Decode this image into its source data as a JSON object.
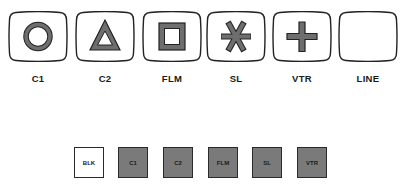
{
  "monitors": [
    {
      "label": "C1",
      "icon": "circle",
      "x": 8
    },
    {
      "label": "C2",
      "icon": "triangle",
      "x": 75
    },
    {
      "label": "FLM",
      "icon": "square",
      "x": 142
    },
    {
      "label": "SL",
      "icon": "asterisk",
      "x": 206
    },
    {
      "label": "VTR",
      "icon": "plus",
      "x": 272
    },
    {
      "label": "LINE",
      "icon": "blank",
      "x": 338
    }
  ],
  "buttons": [
    {
      "label": "BLK",
      "lit": false,
      "x": 74
    },
    {
      "label": "C1",
      "lit": true,
      "x": 118
    },
    {
      "label": "C2",
      "lit": true,
      "x": 163
    },
    {
      "label": "FLM",
      "lit": true,
      "x": 208
    },
    {
      "label": "SL",
      "lit": true,
      "x": 252
    },
    {
      "label": "VTR",
      "lit": true,
      "x": 297
    }
  ],
  "colors": {
    "outline": "#222222",
    "shape_fill": "#6e6e6e",
    "button_lit": "#7a7a7a",
    "button_unlit": "#ffffff"
  }
}
